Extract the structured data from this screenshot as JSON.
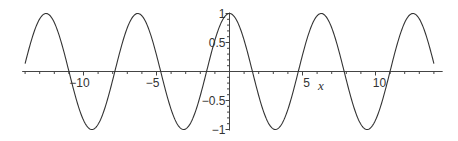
{
  "chart_data": {
    "type": "line",
    "title": "",
    "function": "cos(x)",
    "xlabel": "x",
    "ylabel": "",
    "xlim": [
      -14.2,
      14.6
    ],
    "ylim": [
      -1,
      1
    ],
    "grid": false,
    "legend": null,
    "x_ticks": [
      -10,
      -5,
      5,
      10
    ],
    "x_tick_labels": [
      "−10",
      "−5",
      "5",
      "10"
    ],
    "x_minor_tick_step": 1,
    "y_ticks": [
      1,
      0.5,
      -0.5,
      -1
    ],
    "y_tick_labels": [
      "1",
      "0.5",
      "−0.5",
      "−1"
    ],
    "y_minor_tick_step": 0.1,
    "series": [
      {
        "name": "cos(x)",
        "color": "#333333",
        "x": [
          -14,
          -12.566,
          -11,
          -9.425,
          -7.854,
          -6.283,
          -4.712,
          -3.142,
          -1.571,
          0,
          1.571,
          3.142,
          4.712,
          6.283,
          7.854,
          9.425,
          11,
          12.566,
          14
        ],
        "values": [
          0.137,
          1,
          0.004,
          -1,
          0,
          1,
          0,
          -1,
          0,
          1,
          0,
          -1,
          0,
          1,
          0,
          -1,
          0.004,
          1,
          0.137
        ]
      }
    ]
  },
  "colors": {
    "curve": "#333333",
    "axis": "#444444",
    "background": "#ffffff"
  }
}
